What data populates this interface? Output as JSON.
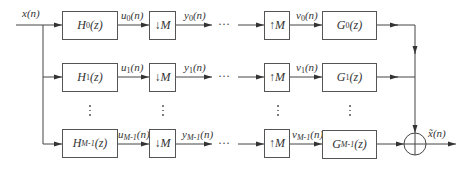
{
  "diagram": {
    "type": "M-channel filter bank (analysis/synthesis) block diagram",
    "input_label": "x(n)",
    "output_label": "x̃(n)",
    "ellipsis_horizontal": "···",
    "rows": [
      {
        "analysis_filter": {
          "base": "H",
          "sub": "0",
          "arg": "(z)"
        },
        "u": {
          "base": "u",
          "sub": "0",
          "arg": "(n)"
        },
        "decimator": "↓M",
        "y": {
          "base": "y",
          "sub": "0",
          "arg": "(n)"
        },
        "expander": "↑M",
        "v": {
          "base": "v",
          "sub": "0",
          "arg": "(n)"
        },
        "synthesis_filter": {
          "base": "G",
          "sub": "0",
          "arg": "(z)"
        }
      },
      {
        "analysis_filter": {
          "base": "H",
          "sub": "1",
          "arg": "(z)"
        },
        "u": {
          "base": "u",
          "sub": "1",
          "arg": "(n)"
        },
        "decimator": "↓M",
        "y": {
          "base": "y",
          "sub": "1",
          "arg": "(n)"
        },
        "expander": "↑M",
        "v": {
          "base": "v",
          "sub": "1",
          "arg": "(n)"
        },
        "synthesis_filter": {
          "base": "G",
          "sub": "1",
          "arg": "(z)"
        }
      },
      {
        "analysis_filter": {
          "base": "H",
          "sub": "M-1",
          "arg": "(z)"
        },
        "u": {
          "base": "u",
          "sub": "M-1",
          "arg": "(n)"
        },
        "decimator": "↓M",
        "y": {
          "base": "y",
          "sub": "M-1",
          "arg": "(n)"
        },
        "expander": "↑M",
        "v": {
          "base": "v",
          "sub": "M-1",
          "arg": "(n)"
        },
        "synthesis_filter": {
          "base": "G",
          "sub": "M-1",
          "arg": "(z)"
        }
      }
    ],
    "summing_node": "adder (circle with plus)",
    "colors": {
      "line": "#444444",
      "text": "#333333",
      "background": "#ffffff"
    }
  }
}
